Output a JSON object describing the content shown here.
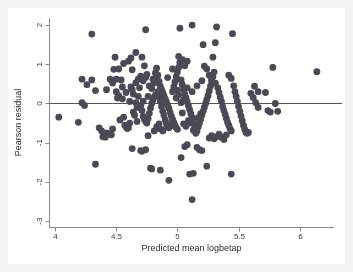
{
  "chart_data": {
    "type": "scatter",
    "title": "",
    "xlabel": "Predicted mean logbetap",
    "ylabel": "Pearson residual",
    "xlim": [
      3.95,
      6.28
    ],
    "ylim": [
      -3.15,
      2.18
    ],
    "xticks": [
      4,
      4.5,
      5,
      5.5,
      6
    ],
    "xticklabels": [
      "4",
      "4.5",
      "5",
      "5.5",
      "6"
    ],
    "yticks": [
      2,
      1,
      0,
      -1,
      -2,
      -3
    ],
    "yticklabels": [
      "2",
      "1",
      "0",
      "-1",
      "-2",
      "-3"
    ],
    "grid": false,
    "legend": null,
    "marker_color": "#4a4a55",
    "marker_size": 3.4,
    "reference_lines": [
      {
        "orientation": "horizontal",
        "value": 0,
        "color": "#555560",
        "width": 1
      }
    ],
    "background_color": "#ffffff",
    "outer_background_color": "#f4f4f4",
    "axis_color": "#888890",
    "points": [
      [
        4.03,
        -0.35
      ],
      [
        4.19,
        -0.48
      ],
      [
        4.3,
        1.77
      ],
      [
        4.33,
        -1.55
      ],
      [
        4.22,
        0.02
      ],
      [
        4.24,
        -0.05
      ],
      [
        4.22,
        0.62
      ],
      [
        4.26,
        0.48
      ],
      [
        4.3,
        0.6
      ],
      [
        4.33,
        0.33
      ],
      [
        4.36,
        -0.62
      ],
      [
        4.38,
        -0.7
      ],
      [
        4.39,
        -0.85
      ],
      [
        4.41,
        -0.86
      ],
      [
        4.42,
        -0.75
      ],
      [
        4.44,
        -0.78
      ],
      [
        4.46,
        -0.8
      ],
      [
        4.47,
        0.52
      ],
      [
        4.48,
        0.87
      ],
      [
        4.49,
        1.18
      ],
      [
        4.5,
        0.62
      ],
      [
        4.5,
        0.3
      ],
      [
        4.51,
        0.14
      ],
      [
        4.52,
        0.2
      ],
      [
        4.53,
        -0.42
      ],
      [
        4.54,
        0.6
      ],
      [
        4.55,
        0.12
      ],
      [
        4.56,
        -0.35
      ],
      [
        4.57,
        -0.55
      ],
      [
        4.58,
        -0.6
      ],
      [
        4.59,
        -0.64
      ],
      [
        4.6,
        -0.62
      ],
      [
        4.61,
        0.05
      ],
      [
        4.62,
        0.42
      ],
      [
        4.63,
        0.35
      ],
      [
        4.64,
        -0.22
      ],
      [
        4.65,
        -0.3
      ],
      [
        4.66,
        0.02
      ],
      [
        4.67,
        -0.1
      ],
      [
        4.68,
        0.18
      ],
      [
        4.56,
        1.02
      ],
      [
        4.6,
        1.08
      ],
      [
        4.62,
        1.16
      ],
      [
        4.63,
        0.86
      ],
      [
        4.66,
        0.53
      ],
      [
        4.68,
        0.62
      ],
      [
        4.69,
        0.4
      ],
      [
        4.7,
        -0.05
      ],
      [
        4.71,
        -0.18
      ],
      [
        4.72,
        -0.33
      ],
      [
        4.73,
        -0.4
      ],
      [
        4.74,
        -0.46
      ],
      [
        4.75,
        -0.5
      ],
      [
        4.76,
        -0.38
      ],
      [
        4.77,
        -0.25
      ],
      [
        4.78,
        -0.12
      ],
      [
        4.79,
        0.0
      ],
      [
        4.8,
        0.08
      ],
      [
        4.81,
        0.16
      ],
      [
        4.82,
        0.22
      ],
      [
        4.7,
        0.7
      ],
      [
        4.72,
        0.58
      ],
      [
        4.74,
        0.66
      ],
      [
        4.75,
        0.74
      ],
      [
        4.77,
        0.45
      ],
      [
        4.79,
        0.38
      ],
      [
        4.81,
        0.52
      ],
      [
        4.83,
        0.6
      ],
      [
        4.84,
        0.3
      ],
      [
        4.85,
        0.18
      ],
      [
        4.86,
        0.05
      ],
      [
        4.87,
        -0.08
      ],
      [
        4.88,
        -0.2
      ],
      [
        4.89,
        -0.3
      ],
      [
        4.9,
        -0.42
      ],
      [
        4.91,
        -0.52
      ],
      [
        4.92,
        -0.6
      ],
      [
        4.93,
        -0.62
      ],
      [
        4.94,
        -0.58
      ],
      [
        4.95,
        -0.48
      ],
      [
        4.71,
        1.18
      ],
      [
        4.73,
        0.96
      ],
      [
        4.66,
        1.3
      ],
      [
        4.7,
        -1.2
      ],
      [
        4.71,
        -1.22
      ],
      [
        4.74,
        -1.18
      ],
      [
        4.63,
        -1.15
      ],
      [
        4.76,
        -0.82
      ],
      [
        4.78,
        -1.65
      ],
      [
        4.79,
        -1.67
      ],
      [
        4.86,
        -1.7
      ],
      [
        4.74,
        1.88
      ],
      [
        4.8,
        0.62
      ],
      [
        4.82,
        0.78
      ],
      [
        4.83,
        0.9
      ],
      [
        4.84,
        0.72
      ],
      [
        4.85,
        0.56
      ],
      [
        4.86,
        0.44
      ],
      [
        4.87,
        0.36
      ],
      [
        4.88,
        0.28
      ],
      [
        4.89,
        0.2
      ],
      [
        4.9,
        0.12
      ],
      [
        4.91,
        0.04
      ],
      [
        4.92,
        -0.04
      ],
      [
        4.93,
        -0.12
      ],
      [
        4.94,
        -0.22
      ],
      [
        4.95,
        -0.32
      ],
      [
        4.96,
        -0.4
      ],
      [
        4.97,
        -0.48
      ],
      [
        4.98,
        -0.56
      ],
      [
        4.99,
        -0.62
      ],
      [
        5.0,
        -0.66
      ],
      [
        4.96,
        0.3
      ],
      [
        4.97,
        0.42
      ],
      [
        4.98,
        0.55
      ],
      [
        4.99,
        0.68
      ],
      [
        5.0,
        0.8
      ],
      [
        5.01,
        0.92
      ],
      [
        5.02,
        1.05
      ],
      [
        5.03,
        0.6
      ],
      [
        5.04,
        0.48
      ],
      [
        5.05,
        0.36
      ],
      [
        5.06,
        0.24
      ],
      [
        5.07,
        0.14
      ],
      [
        5.08,
        0.04
      ],
      [
        5.09,
        -0.06
      ],
      [
        5.1,
        -0.16
      ],
      [
        5.11,
        -0.26
      ],
      [
        5.12,
        -0.36
      ],
      [
        5.13,
        -0.46
      ],
      [
        5.14,
        -0.54
      ],
      [
        5.15,
        -0.62
      ],
      [
        5.02,
        1.92
      ],
      [
        5.12,
        2.0
      ],
      [
        4.93,
        -1.96
      ],
      [
        5.1,
        -1.8
      ],
      [
        5.13,
        -1.78
      ],
      [
        5.12,
        -2.45
      ],
      [
        5.03,
        -1.38
      ],
      [
        5.06,
        -1.1
      ],
      [
        5.08,
        -1.05
      ],
      [
        5.16,
        -1.12
      ],
      [
        5.18,
        -1.18
      ],
      [
        5.2,
        -1.2
      ],
      [
        5.01,
        1.2
      ],
      [
        5.04,
        1.12
      ],
      [
        5.06,
        0.96
      ],
      [
        5.08,
        1.08
      ],
      [
        5.16,
        -0.7
      ],
      [
        5.17,
        -0.6
      ],
      [
        5.18,
        -0.5
      ],
      [
        5.19,
        -0.4
      ],
      [
        5.2,
        -0.3
      ],
      [
        5.21,
        -0.2
      ],
      [
        5.22,
        -0.1
      ],
      [
        5.23,
        0.0
      ],
      [
        5.24,
        0.1
      ],
      [
        5.25,
        0.2
      ],
      [
        5.26,
        0.32
      ],
      [
        5.27,
        0.44
      ],
      [
        5.28,
        0.56
      ],
      [
        5.29,
        0.68
      ],
      [
        5.3,
        0.8
      ],
      [
        5.31,
        0.52
      ],
      [
        5.21,
        1.5
      ],
      [
        5.29,
        1.18
      ],
      [
        5.31,
        1.55
      ],
      [
        5.32,
        1.95
      ],
      [
        5.22,
        0.95
      ],
      [
        5.24,
        0.88
      ],
      [
        5.26,
        0.72
      ],
      [
        5.28,
        0.6
      ],
      [
        5.33,
        0.4
      ],
      [
        5.34,
        0.28
      ],
      [
        5.35,
        0.16
      ],
      [
        5.36,
        0.05
      ],
      [
        5.37,
        -0.08
      ],
      [
        5.38,
        -0.18
      ],
      [
        5.39,
        -0.28
      ],
      [
        5.4,
        -0.38
      ],
      [
        5.41,
        -0.48
      ],
      [
        5.42,
        -0.56
      ],
      [
        5.43,
        -0.64
      ],
      [
        5.44,
        -0.7
      ],
      [
        5.26,
        -0.88
      ],
      [
        5.28,
        -0.82
      ],
      [
        5.3,
        -0.9
      ],
      [
        5.32,
        -0.85
      ],
      [
        5.34,
        -0.78
      ],
      [
        5.36,
        -0.86
      ],
      [
        5.38,
        -0.92
      ],
      [
        5.4,
        -0.8
      ],
      [
        5.24,
        -1.6
      ],
      [
        5.44,
        -1.8
      ],
      [
        5.42,
        0.72
      ],
      [
        5.44,
        0.64
      ],
      [
        5.45,
        1.78
      ],
      [
        5.46,
        0.45
      ],
      [
        5.47,
        0.3
      ],
      [
        5.48,
        0.18
      ],
      [
        5.49,
        0.05
      ],
      [
        5.5,
        -0.08
      ],
      [
        5.51,
        -0.2
      ],
      [
        5.52,
        -0.32
      ],
      [
        5.53,
        -0.44
      ],
      [
        5.54,
        -0.56
      ],
      [
        5.55,
        -0.66
      ],
      [
        5.56,
        -0.74
      ],
      [
        5.57,
        -0.76
      ],
      [
        5.58,
        -0.74
      ],
      [
        5.6,
        0.26
      ],
      [
        5.62,
        0.15
      ],
      [
        5.64,
        0.02
      ],
      [
        5.66,
        -0.1
      ],
      [
        5.63,
        0.44
      ],
      [
        5.66,
        0.3
      ],
      [
        5.72,
        0.28
      ],
      [
        5.74,
        -0.18
      ],
      [
        5.76,
        -0.22
      ],
      [
        5.78,
        0.92
      ],
      [
        5.8,
        0.0
      ],
      [
        5.82,
        -0.2
      ],
      [
        6.14,
        0.81
      ],
      [
        4.45,
        0.62
      ],
      [
        4.42,
        0.35
      ],
      [
        4.47,
        -0.65
      ],
      [
        4.52,
        0.88
      ],
      [
        4.55,
        0.42
      ],
      [
        4.58,
        0.28
      ],
      [
        4.61,
        -0.5
      ],
      [
        4.64,
        0.24
      ],
      [
        4.67,
        -0.46
      ],
      [
        4.72,
        0.06
      ],
      [
        4.76,
        0.18
      ],
      [
        4.84,
        -0.64
      ],
      [
        4.88,
        -0.7
      ],
      [
        4.92,
        0.66
      ],
      [
        4.96,
        0.88
      ],
      [
        5.0,
        0.34
      ],
      [
        5.04,
        -0.24
      ],
      [
        5.08,
        0.4
      ],
      [
        5.12,
        0.3
      ],
      [
        5.16,
        0.45
      ],
      [
        5.2,
        0.58
      ],
      [
        5.05,
        -0.52
      ],
      [
        5.07,
        -0.58
      ],
      [
        5.09,
        -0.44
      ],
      [
        5.11,
        -0.5
      ],
      [
        5.13,
        -0.68
      ],
      [
        5.15,
        -0.76
      ],
      [
        5.17,
        -0.36
      ],
      [
        5.19,
        -0.26
      ],
      [
        4.99,
        0.14
      ],
      [
        5.01,
        0.22
      ],
      [
        5.03,
        0.02
      ],
      [
        5.05,
        0.1
      ],
      [
        4.81,
        -0.7
      ],
      [
        4.83,
        -0.6
      ],
      [
        4.85,
        -0.52
      ],
      [
        4.87,
        -0.66
      ]
    ]
  }
}
